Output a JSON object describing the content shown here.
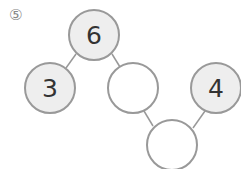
{
  "problem_number": "⑤",
  "nodes": [
    {
      "id": "top",
      "value": "6",
      "filled": true
    },
    {
      "id": "left",
      "value": "3",
      "filled": true
    },
    {
      "id": "middle",
      "value": "",
      "filled": false
    },
    {
      "id": "right",
      "value": "4",
      "filled": true
    },
    {
      "id": "bottom",
      "value": "",
      "filled": false
    }
  ],
  "colors": {
    "filled": "#eeeeee",
    "stroke": "#999999",
    "line": "#999999",
    "text": "#333333"
  }
}
